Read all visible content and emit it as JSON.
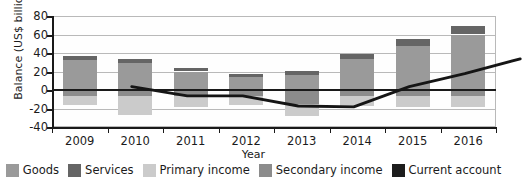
{
  "chart_data": {
    "type": "bar",
    "title": "",
    "xlabel": "Year",
    "ylabel": "Balance (US$ billion)",
    "categories": [
      "2009",
      "2010",
      "2011",
      "2012",
      "2013",
      "2014",
      "2015",
      "2016"
    ],
    "ylim": [
      -40,
      80
    ],
    "yticks": [
      -40,
      -20,
      0,
      20,
      40,
      60,
      80
    ],
    "ytick_labels": [
      "-40",
      "-20",
      "0",
      "20",
      "40",
      "60",
      "80"
    ],
    "grid": true,
    "legend_position": "bottom",
    "stacked": true,
    "series": [
      {
        "name": "Goods",
        "type": "bar",
        "color": "#9a9a9a",
        "values": [
          32,
          29,
          20,
          14,
          16,
          33,
          48,
          60
        ]
      },
      {
        "name": "Services",
        "type": "bar",
        "color": "#656565",
        "values": [
          5,
          5,
          4,
          3,
          5,
          6,
          7,
          9
        ]
      },
      {
        "name": "Primary income",
        "type": "bar",
        "color": "#cbcbcb",
        "values": [
          -9,
          -21,
          -11,
          -9,
          -13,
          -11,
          -12,
          -12
        ]
      },
      {
        "name": "Secondary income",
        "type": "bar",
        "color": "#8c8c8c",
        "values": [
          -7,
          -6,
          -7,
          -7,
          -15,
          -6,
          -6,
          -6
        ]
      },
      {
        "name": "Current account",
        "type": "line",
        "color": "#151515",
        "values": [
          21,
          11,
          11,
          0,
          -1,
          21,
          35,
          51
        ]
      }
    ]
  },
  "legend": {
    "items": [
      {
        "label": "Goods",
        "color": "#9a9a9a"
      },
      {
        "label": "Services",
        "color": "#656565"
      },
      {
        "label": "Primary income",
        "color": "#cbcbcb"
      },
      {
        "label": "Secondary income",
        "color": "#8c8c8c"
      },
      {
        "label": "Current account",
        "color": "#1d1d1d"
      }
    ]
  }
}
